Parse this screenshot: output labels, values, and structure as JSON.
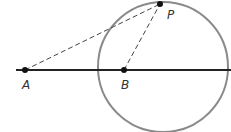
{
  "diagram": {
    "points": {
      "A": {
        "label": "A",
        "x": 25,
        "y": 70
      },
      "B": {
        "label": "B",
        "x": 124,
        "y": 70
      },
      "P": {
        "label": "P",
        "x": 160,
        "y": 4
      }
    },
    "circle": {
      "cx": 163,
      "cy": 67,
      "r": 66,
      "color": "#888888"
    },
    "line": {
      "x1": 16,
      "x2": 231,
      "y": 70,
      "color": "#222222"
    },
    "dashed_segments": [
      {
        "from": "A",
        "to": "P"
      },
      {
        "from": "B",
        "to": "P"
      }
    ]
  }
}
